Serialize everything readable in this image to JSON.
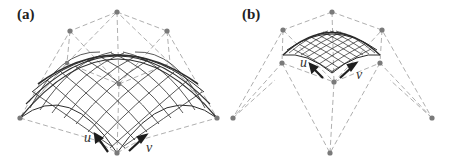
{
  "figure": {
    "panels": [
      {
        "id": "a",
        "label": "(a)",
        "axis_u": "u",
        "axis_v": "v",
        "description": "Bezier surface patch with control net, full dome spanning control polygon"
      },
      {
        "id": "b",
        "label": "(b)",
        "axis_u": "u",
        "axis_v": "v",
        "description": "Smaller sub-patch of surface with wider control net"
      }
    ],
    "colors": {
      "control_point": "#777777",
      "control_net": "#999999",
      "surface_mesh": "#333333",
      "arrow": "#222222"
    }
  }
}
